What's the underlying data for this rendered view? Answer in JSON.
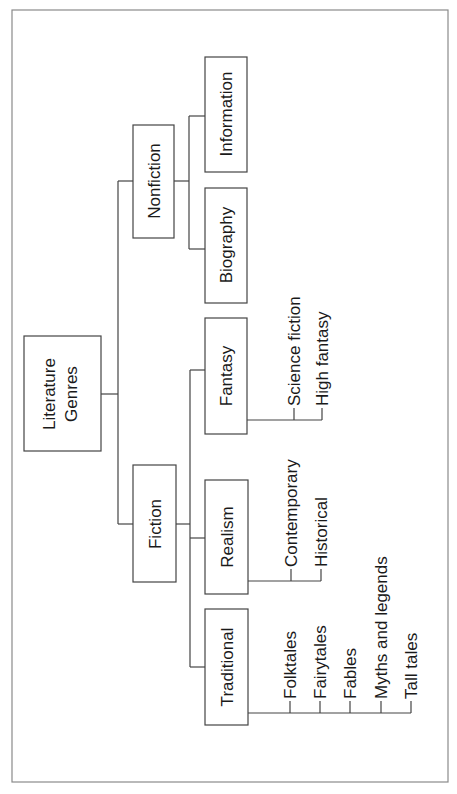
{
  "diagram": {
    "type": "tree",
    "orientation": "rotated-90-ccw",
    "root": {
      "label_lines": [
        "Literature",
        "Genres"
      ]
    },
    "categories": [
      {
        "label": "Nonfiction",
        "children": [
          {
            "label": "Information",
            "children": []
          },
          {
            "label": "Biography",
            "children": []
          }
        ]
      },
      {
        "label": "Fiction",
        "children": [
          {
            "label": "Fantasy",
            "children": [
              "Science fiction",
              "High fantasy"
            ]
          },
          {
            "label": "Realism",
            "children": [
              "Contemporary",
              "Historical"
            ]
          },
          {
            "label": "Traditional",
            "children": [
              "Folktales",
              "Fairytales",
              "Fables",
              "Myths and legends",
              "Tall tales"
            ]
          }
        ]
      }
    ],
    "colors": {
      "line": "#444444",
      "frame": "#8a8a8a",
      "text": "#1a1a1a",
      "background": "#ffffff"
    }
  }
}
